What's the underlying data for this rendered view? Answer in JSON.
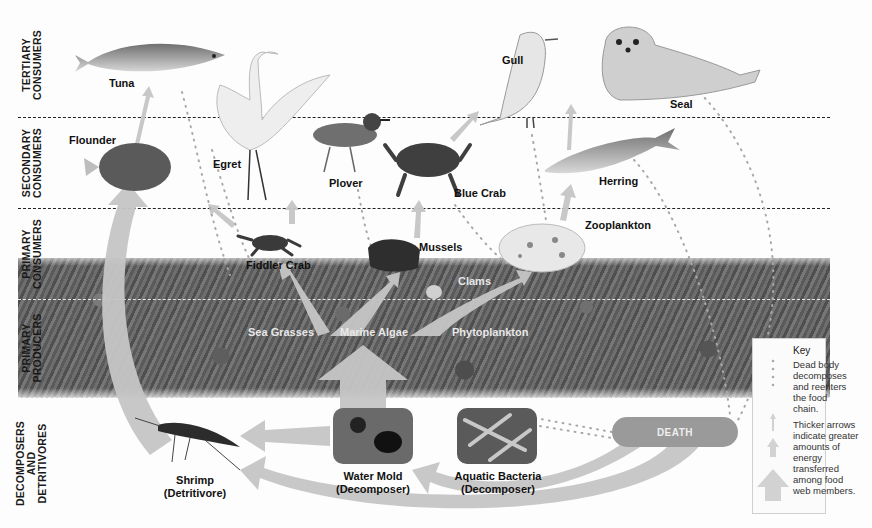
{
  "diagram": {
    "palette": {
      "background": "#fdfdfd",
      "arrow": "#c4c4c4",
      "text": "#111111",
      "seabed": "#5f5f5f",
      "death_pill": "#9a9a9a",
      "key_border": "#cfcfcf"
    }
  },
  "zones": [
    {
      "id": "tertiary",
      "label": "TERTIARY CONSUMERS"
    },
    {
      "id": "secondary",
      "label": "SECONDARY CONSUMERS"
    },
    {
      "id": "primary_consumers",
      "label": "PRIMARY CONSUMERS"
    },
    {
      "id": "primary_producers",
      "label": "PRIMARY PRODUCERS"
    },
    {
      "id": "decomposers",
      "label": "DECOMPOSERS AND DETRITIVORES"
    }
  ],
  "organisms": {
    "tuna": "Tuna",
    "egret": "Egret",
    "gull": "Gull",
    "seal": "Seal",
    "flounder": "Flounder",
    "plover": "Plover",
    "blue_crab": "Blue Crab",
    "herring": "Herring",
    "fiddler_crab": "Fiddler Crab",
    "mussels": "Mussels",
    "clams": "Clams",
    "zooplankton": "Zooplankton",
    "sea_grasses": "Sea Grasses",
    "marine_algae": "Marine Algae",
    "phytoplankton": "Phytoplankton",
    "shrimp": "Shrimp",
    "shrimp_role": "(Detritivore)",
    "water_mold": "Water Mold",
    "water_mold_role": "(Decomposer)",
    "aquatic_bacteria": "Aquatic Bacteria",
    "aquatic_bacteria_role": "(Decomposer)"
  },
  "death": {
    "label": "DEATH"
  },
  "key": {
    "title": "Key",
    "dotted_desc": "Dead body decomposes and reenters the food chain.",
    "arrow_desc": "Thicker arrows indicate greater amounts of energy transferred among food web members."
  }
}
